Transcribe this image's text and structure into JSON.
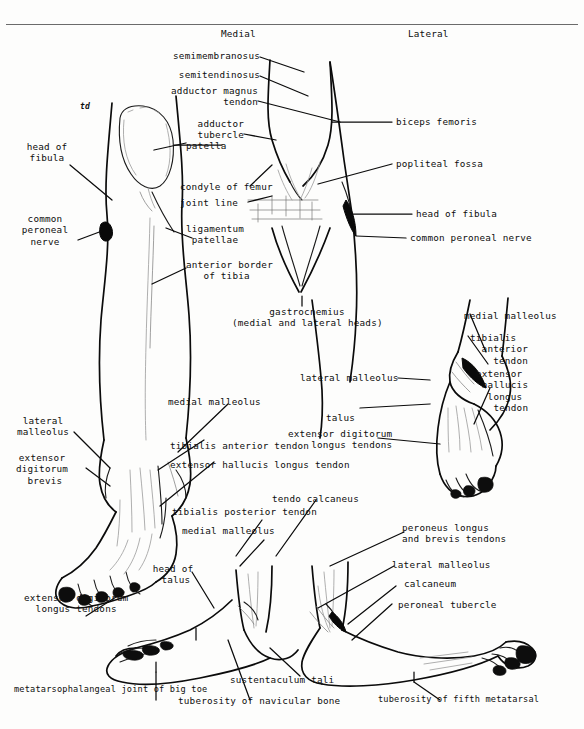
{
  "figure": {
    "domain": "anatomical-line-drawing",
    "title_visible": false,
    "orientation_labels": {
      "medial": "Medial",
      "lateral": "Lateral"
    },
    "script_mark": "td"
  },
  "labels": {
    "knee_anterior_left": [
      {
        "id": "head-of-fibula-left",
        "text": "head of\nfibula"
      },
      {
        "id": "common-peroneal-nerve-left",
        "text": "common\nperoneal\nnerve"
      }
    ],
    "knee_anterior_center": [
      {
        "id": "semimembranosus",
        "text": "semimembranosus"
      },
      {
        "id": "semitendinosus",
        "text": "semitendinosus"
      },
      {
        "id": "adductor-magnus-tendon",
        "text": "adductor magnus\n      tendon"
      },
      {
        "id": "adductor-tubercle",
        "text": "adductor\ntubercle"
      },
      {
        "id": "patella",
        "text": "patella"
      },
      {
        "id": "condyle-of-femur",
        "text": "condyle of femur"
      },
      {
        "id": "joint-line",
        "text": "joint line"
      },
      {
        "id": "ligamentum-patellae",
        "text": "ligamentum\n patellae"
      },
      {
        "id": "anterior-border-of-tibia",
        "text": "anterior border\n   of tibia"
      }
    ],
    "knee_posterior_right": [
      {
        "id": "biceps-femoris",
        "text": "biceps femoris"
      },
      {
        "id": "popliteal-fossa",
        "text": "popliteal fossa"
      },
      {
        "id": "head-of-fibula-right",
        "text": "head of fibula"
      },
      {
        "id": "common-peroneal-nerve-right",
        "text": "common peroneal nerve"
      },
      {
        "id": "gastrocnemius",
        "text": "gastrocnemius\n(medial and lateral heads)"
      }
    ],
    "foot_dorsum_right": [
      {
        "id": "medial-malleolus-dorsum",
        "text": "medial malleolus"
      },
      {
        "id": "tibialis-anterior-tendon-dorsum",
        "text": "tibialis\n  anterior\n    tendon"
      },
      {
        "id": "extensor-hallucis-longus-tendon-dorsum",
        "text": "extensor\n hallucis\n  longus\n   tendon"
      },
      {
        "id": "lateral-malleolus-dorsum",
        "text": "lateral malleolus"
      },
      {
        "id": "talus",
        "text": "talus"
      },
      {
        "id": "extensor-digitorum-longus-tendons-dorsum",
        "text": "extensor digitorum\n    longus tendons"
      }
    ],
    "foot_anterior_left": [
      {
        "id": "lateral-malleolus-left",
        "text": "lateral\nmalleolus"
      },
      {
        "id": "extensor-digitorum-brevis",
        "text": "extensor\ndigitorum\n brevis"
      },
      {
        "id": "medial-malleolus-ankle",
        "text": "medial malleolus"
      },
      {
        "id": "tibialis-anterior-tendon-ankle",
        "text": "tibialis anterior tendon"
      },
      {
        "id": "extensor-hallucis-longus-tendon-ankle",
        "text": "extensor hallucis longus tendon"
      },
      {
        "id": "extensor-digitorum-longus-tendons-left",
        "text": "extensor digitorum\n  longus tendons"
      }
    ],
    "foot_medial_bottom": [
      {
        "id": "tibialis-posterior-tendon",
        "text": "tibialis posterior tendon"
      },
      {
        "id": "medial-malleolus-bottom",
        "text": "medial malleolus"
      },
      {
        "id": "head-of-talus",
        "text": "head of\n talus"
      },
      {
        "id": "tendo-calcaneus",
        "text": "tendo calcaneus"
      },
      {
        "id": "sustentaculum-tali",
        "text": "sustentaculum tali"
      },
      {
        "id": "tuberosity-of-navicular-bone",
        "text": "tuberosity of navicular bone"
      },
      {
        "id": "metatarsophalangeal-joint-of-big-toe",
        "text": "metatarsophalangeal joint of big toe"
      }
    ],
    "foot_lateral_bottom": [
      {
        "id": "peroneus-longus-and-brevis-tendons",
        "text": "peroneus longus\nand brevis tendons"
      },
      {
        "id": "lateral-malleolus-bottom",
        "text": "lateral malleolus"
      },
      {
        "id": "calcaneum",
        "text": "calcaneum"
      },
      {
        "id": "peroneal-tubercle",
        "text": "peroneal tubercle"
      },
      {
        "id": "tuberosity-of-fifth-metatarsal",
        "text": "tuberosity of fifth metatarsal"
      }
    ]
  },
  "colors": {
    "ink": "#0b0b0b",
    "paper": "#fdfdfc",
    "rule": "#6b6b6b",
    "hairline": "#9a9a9a"
  }
}
